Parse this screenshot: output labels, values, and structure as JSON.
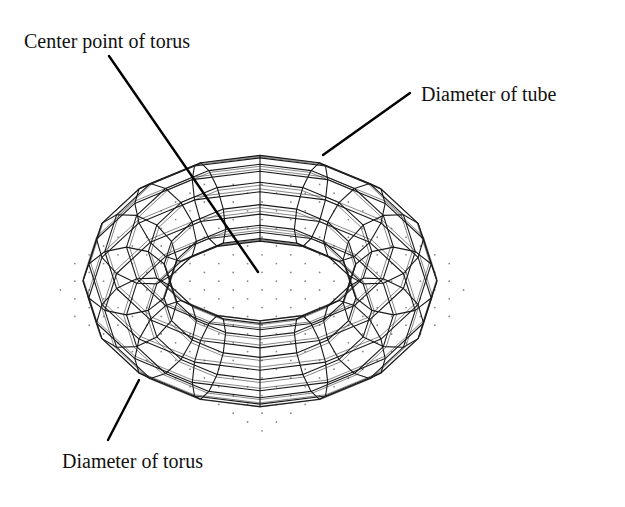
{
  "diagram": {
    "labels": {
      "center_point": "Center point of torus",
      "tube_diameter": "Diameter of tube",
      "torus_diameter": "Diameter of torus"
    },
    "colors": {
      "background": "#ffffff",
      "wireframe": "#1a1a1a",
      "leader_line": "#000000",
      "grid_dots": "#8a8a8a",
      "text": "#111111"
    },
    "torus": {
      "center": [
        260,
        281
      ],
      "outer_radius_x": 177,
      "outer_radius_y": 124,
      "inner_radius_x": 90,
      "inner_radius_y": 33,
      "meridians": 16,
      "parallels": 12
    },
    "leaders": {
      "center_point": {
        "from": [
          109,
          56
        ],
        "to": [
          258,
          272
        ]
      },
      "tube_diameter": {
        "from": [
          410,
          93
        ],
        "to": [
          323,
          155
        ]
      },
      "torus_diameter": {
        "from": [
          139,
          380
        ],
        "to": [
          108,
          440
        ]
      }
    }
  }
}
